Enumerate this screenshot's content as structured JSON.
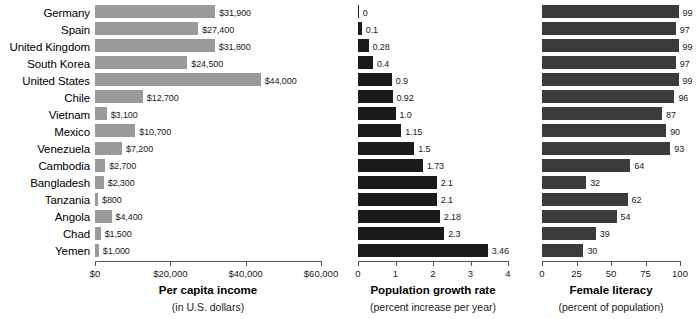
{
  "chart_data": [
    {
      "type": "bar",
      "title": "Per capita income",
      "subtitle": "(in U.S. dollars)",
      "orientation": "horizontal",
      "xlabel": "",
      "ylabel": "",
      "xlim": [
        0,
        60000
      ],
      "grid": false,
      "legend": "none",
      "bar_color": "#9a9a9a",
      "tick_labels": [
        "$0",
        "$20,000",
        "$40,000",
        "$60,000"
      ],
      "tick_values": [
        0,
        20000,
        40000,
        60000
      ],
      "categories": [
        "Germany",
        "Spain",
        "United Kingdom",
        "South Korea",
        "United States",
        "Chile",
        "Vietnam",
        "Mexico",
        "Venezuela",
        "Cambodia",
        "Bangladesh",
        "Tanzania",
        "Angola",
        "Chad",
        "Yemen"
      ],
      "values": [
        31900,
        27400,
        31800,
        24500,
        44000,
        12700,
        3100,
        10700,
        7200,
        2700,
        2300,
        800,
        4400,
        1500,
        1000
      ],
      "data_labels": [
        "$31,900",
        "$27,400",
        "$31,800",
        "$24,500",
        "$44,000",
        "$12,700",
        "$3,100",
        "$10,700",
        "$7,200",
        "$2,700",
        "$2,300",
        "$800",
        "$4,400",
        "$1,500",
        "$1,000"
      ]
    },
    {
      "type": "bar",
      "title": "Population growth rate",
      "subtitle": "(percent increase per year)",
      "orientation": "horizontal",
      "xlabel": "",
      "ylabel": "",
      "xlim": [
        0,
        4
      ],
      "grid": false,
      "legend": "none",
      "bar_color": "#1b1b1b",
      "tick_labels": [
        "0",
        "1",
        "2",
        "3",
        "4"
      ],
      "tick_values": [
        0,
        1,
        2,
        3,
        4
      ],
      "categories": [
        "Germany",
        "Spain",
        "United Kingdom",
        "South Korea",
        "United States",
        "Chile",
        "Vietnam",
        "Mexico",
        "Venezuela",
        "Cambodia",
        "Bangladesh",
        "Tanzania",
        "Angola",
        "Chad",
        "Yemen"
      ],
      "values": [
        0,
        0.1,
        0.28,
        0.4,
        0.9,
        0.92,
        1.0,
        1.15,
        1.5,
        1.73,
        2.1,
        2.1,
        2.18,
        2.3,
        3.46
      ],
      "data_labels": [
        "0",
        "0.1",
        "0.28",
        "0.4",
        "0.9",
        "0.92",
        "1.0",
        "1.15",
        "1.5",
        "1.73",
        "2.1",
        "2.1",
        "2.18",
        "2.3",
        "3.46"
      ]
    },
    {
      "type": "bar",
      "title": "Female literacy",
      "subtitle": "(percent of population)",
      "orientation": "horizontal",
      "xlabel": "",
      "ylabel": "",
      "xlim": [
        0,
        100
      ],
      "grid": false,
      "legend": "none",
      "bar_color": "#3b3b3b",
      "tick_labels": [
        "0",
        "25",
        "50",
        "75",
        "100"
      ],
      "tick_values": [
        0,
        25,
        50,
        75,
        100
      ],
      "categories": [
        "Germany",
        "Spain",
        "United Kingdom",
        "South Korea",
        "United States",
        "Chile",
        "Vietnam",
        "Mexico",
        "Venezuela",
        "Cambodia",
        "Bangladesh",
        "Tanzania",
        "Angola",
        "Chad",
        "Yemen"
      ],
      "values": [
        99,
        97,
        99,
        97,
        99,
        96,
        87,
        90,
        93,
        64,
        32,
        62,
        54,
        39,
        30
      ],
      "data_labels": [
        "99",
        "97",
        "99",
        "97",
        "99",
        "96",
        "87",
        "90",
        "93",
        "64",
        "32",
        "62",
        "54",
        "39",
        "30"
      ]
    }
  ],
  "panels": [
    {
      "left": 95,
      "width": 226,
      "title": "Per capita income",
      "subtitle": "(in U.S. dollars)"
    },
    {
      "left": 358,
      "width": 150,
      "title": "Population growth rate",
      "subtitle": "(percent increase per year)"
    },
    {
      "left": 542,
      "width": 138,
      "title": "Female literacy",
      "subtitle": "(percent of population)"
    }
  ]
}
